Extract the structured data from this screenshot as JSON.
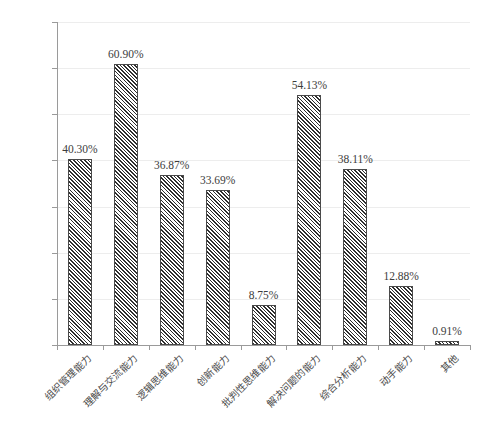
{
  "chart_data": {
    "type": "bar",
    "title": "",
    "subtitle": "",
    "xlabel": "",
    "ylabel": "",
    "grid": true,
    "legend": "none",
    "ylim": [
      0,
      70
    ],
    "y_tick_labels": [
      "0.00%",
      "10.00%",
      "20.00%",
      "30.00%",
      "40.00%",
      "50.00%",
      "60.00%",
      "70.00%"
    ],
    "y_ticks": [
      0,
      10,
      20,
      30,
      40,
      50,
      60,
      70
    ],
    "categories": [
      "组织管理能力",
      "理解与交流能力",
      "逻辑思维能力",
      "创新能力",
      "批判性思维能力",
      "解决问题的能力",
      "综合分析能力",
      "动手能力",
      "其他"
    ],
    "values": [
      40.3,
      60.9,
      36.87,
      33.69,
      8.75,
      54.13,
      38.11,
      12.88,
      0.91
    ],
    "value_labels": [
      "40.30%",
      "60.90%",
      "36.87%",
      "33.69%",
      "8.75%",
      "54.13%",
      "38.11%",
      "12.88%",
      "0.91%"
    ],
    "series_name": "",
    "bar_fill": "diagonal-hatch",
    "bar_color": "#2e2e2e",
    "grid_color": "#ededed",
    "axis_color": "#9a9a9a",
    "text_color": "#3c3c3c",
    "background": "#ffffff"
  }
}
